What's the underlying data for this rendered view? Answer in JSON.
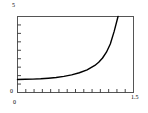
{
  "chart_data": {
    "type": "line",
    "title": "",
    "xlabel": "",
    "ylabel": "",
    "xlim": [
      0,
      1.5
    ],
    "ylim": [
      0,
      5
    ],
    "grid": false,
    "legend": null,
    "x_tick_labels": [
      "0",
      "1.5"
    ],
    "y_tick_labels": [
      "0",
      "5"
    ],
    "x_minor_tick_count": 14,
    "y_minor_tick_count": 9,
    "line_color": "#000000",
    "frame_color": "#555555",
    "series": [
      {
        "name": "curve",
        "x": [
          0.0,
          0.1,
          0.2,
          0.3,
          0.4,
          0.5,
          0.6,
          0.7,
          0.8,
          0.9,
          1.0,
          1.05,
          1.1,
          1.15,
          1.2,
          1.25,
          1.3,
          1.35,
          1.38,
          1.4,
          1.42
        ],
        "y": [
          0.86,
          0.87,
          0.88,
          0.9,
          0.94,
          0.99,
          1.06,
          1.16,
          1.3,
          1.49,
          1.78,
          1.99,
          2.27,
          2.65,
          3.19,
          4.02,
          5.0,
          5.0,
          5.0,
          5.0,
          5.0
        ]
      }
    ]
  },
  "labels": {
    "y_max": "5",
    "y_min": "0",
    "x_min": "0",
    "x_max": "1.5"
  }
}
